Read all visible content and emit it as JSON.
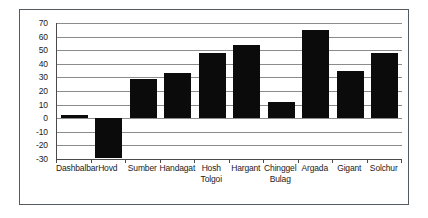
{
  "chart_data": {
    "type": "bar",
    "title": "",
    "subtitle": "",
    "xlabel": "",
    "ylabel": "",
    "ylim": [
      -30,
      70
    ],
    "ytick_step": 10,
    "yticks": [
      70,
      60,
      50,
      40,
      30,
      20,
      10,
      0,
      -10,
      -20,
      -30
    ],
    "ytick_labels": [
      "70",
      "60",
      "50",
      "40",
      "30",
      "20",
      "10",
      "0",
      "-10",
      "-20",
      "-30"
    ],
    "grid": true,
    "legend": false,
    "legend_position": "none",
    "bar_color": "#0b0b0b",
    "gridline_color": "#8c8c8c",
    "axis_color": "#4a4a4a",
    "frame_color": "#555a5e",
    "categories": [
      "Dashbalbar",
      "Hovd",
      "Sumber",
      "Handagat",
      "Hosh Tolgoi",
      "Hargant",
      "Chinggel Bulag",
      "Argada",
      "Gigant",
      "Solchur"
    ],
    "category_lines": [
      [
        "Dashbalbar"
      ],
      [
        "Hovd"
      ],
      [
        "Sumber"
      ],
      [
        "Handagat"
      ],
      [
        "Hosh",
        "Tolgoi"
      ],
      [
        "Hargant"
      ],
      [
        "Chinggel",
        "Bulag"
      ],
      [
        "Argada"
      ],
      [
        "Gigant"
      ],
      [
        "Solchur"
      ]
    ],
    "values": [
      2,
      -29,
      29,
      33,
      48,
      54,
      12,
      65,
      35,
      48
    ]
  }
}
